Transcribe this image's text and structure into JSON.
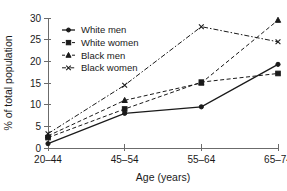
{
  "chart_data": {
    "type": "line",
    "title": "",
    "xlabel": "Age (years)",
    "ylabel": "% of total population",
    "categories": [
      "20–44",
      "45–54",
      "55–64",
      "65–74"
    ],
    "ylim": [
      0,
      30
    ],
    "yticks": [
      0,
      5,
      10,
      15,
      20,
      25,
      30
    ],
    "ytick_labels": [
      "0",
      "5",
      "10",
      "15",
      "20",
      "25",
      "30"
    ],
    "grid": false,
    "legend_position": "upper-left-inside",
    "series": [
      {
        "name": "White men",
        "values": [
          1.0,
          8.0,
          9.5,
          19.3
        ],
        "marker": "circle",
        "line_style": "solid",
        "color": "#1a1a1a"
      },
      {
        "name": "White women",
        "values": [
          2.4,
          9.0,
          15.2,
          17.2
        ],
        "marker": "square",
        "line_style": "dashed",
        "color": "#1a1a1a"
      },
      {
        "name": "Black men",
        "values": [
          2.8,
          11.0,
          15.0,
          29.5
        ],
        "marker": "triangle",
        "line_style": "dashed",
        "color": "#1a1a1a"
      },
      {
        "name": "Black women",
        "values": [
          3.3,
          14.5,
          28.0,
          24.5
        ],
        "marker": "x",
        "line_style": "dash-dot",
        "color": "#1a1a1a"
      }
    ]
  }
}
